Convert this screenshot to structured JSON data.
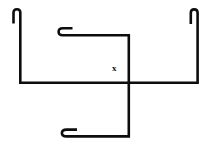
{
  "figure": {
    "canvas": {
      "width": 211,
      "height": 150
    },
    "background_color": "#ffffff",
    "stroke_color": "#0d0d0d",
    "stroke_width": 2.6,
    "labels": [
      {
        "id": "point-x",
        "text": "x",
        "x": 112,
        "y": 64,
        "font_size": 9,
        "color": "#101010"
      }
    ],
    "strokes": [
      {
        "id": "left-branch",
        "name": "left-hook-and-arm",
        "description": "Top-left inverted-U hook, long vertical down, corner right into the main horizontal.",
        "d": "M 13.5 23.5 L 13.5 12.6 Q 13.5 9.3 16.9 9.3 Q 20.3 9.3 20.3 12.6 L 20.3 82.8 L 128.8 82.8"
      },
      {
        "id": "right-branch",
        "name": "right-hook-and-arm",
        "description": "Top-right inverted-U hook, long vertical down, corner left into the main horizontal.",
        "d": "M 190.8 24.0 L 190.8 12.8 Q 190.8 9.4 194.2 9.4 Q 197.6 9.4 197.6 12.8 L 197.6 82.8 L 128.8 82.8"
      },
      {
        "id": "upper-middle-branch",
        "name": "upper-c-hook-and-arm",
        "description": "Top-middle leftward C hook, horizontal right, corner down the central vertical to the crossing.",
        "d": "M 72.5 28.3 L 62.8 28.3 Q 58.6 28.3 58.6 31.8 Q 58.6 35.3 62.8 35.3 L 128.8 35.3 L 128.8 82.8"
      },
      {
        "id": "lower-middle-branch",
        "name": "lower-c-hook-and-arm",
        "description": "Central vertical continuing below the crossing, corner left, horizontal to the bottom leftward C hook.",
        "d": "M 128.8 82.8 L 128.8 136.4 L 66.6 136.4 Q 61.9 136.4 61.9 133.0 Q 61.9 129.6 66.6 129.6 L 77.0 129.6"
      }
    ]
  }
}
